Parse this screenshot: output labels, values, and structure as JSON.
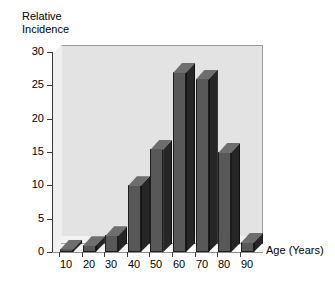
{
  "chart_data": {
    "type": "bar",
    "title": "",
    "subtitle": "",
    "ylabel_line1": "Relative",
    "ylabel_line2": "Incidence",
    "xlabel": "Age (Years)",
    "categories": [
      "10",
      "20",
      "30",
      "40",
      "50",
      "60",
      "70",
      "80",
      "90"
    ],
    "values": [
      0.5,
      1,
      2.5,
      10,
      15.5,
      27,
      26,
      15,
      1.5
    ],
    "yticks": [
      "0",
      "5",
      "10",
      "15",
      "20",
      "25",
      "30"
    ],
    "ytick_values": [
      0,
      5,
      10,
      15,
      20,
      25,
      30
    ],
    "ylim": [
      0,
      30
    ],
    "grid": false,
    "legend": false,
    "style": "3d-column",
    "colors": {
      "bar_front": "#585858",
      "bar_side": "#262626",
      "bar_top": "#6e6e6e",
      "wall": "#e3e3e3",
      "floor": "#f2f2f2",
      "axis": "#3a3a3a",
      "text": "#000000",
      "background": "#ffffff"
    }
  }
}
